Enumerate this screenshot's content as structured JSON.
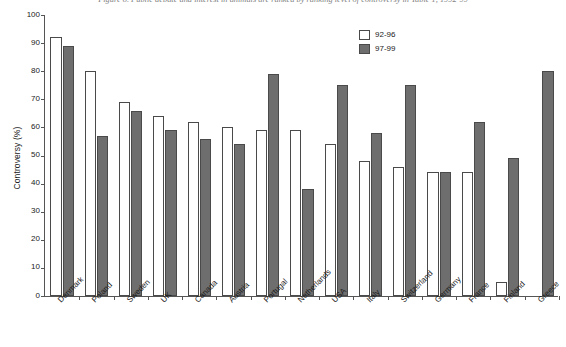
{
  "caption": "Figure 8. Public debate and interest in animals are ranked by ranking level of controversy in Table 1, 1992-99",
  "chart_data": {
    "type": "bar",
    "title": "",
    "xlabel": "",
    "ylabel": "Controversy (%)",
    "ylim": [
      0,
      100
    ],
    "ytick_step": 10,
    "yticks": [
      0,
      10,
      20,
      30,
      40,
      50,
      60,
      70,
      80,
      90,
      100
    ],
    "grid": false,
    "legend_position": "top-right",
    "categories": [
      "Denmark",
      "Poland",
      "Sweden",
      "UK",
      "Canada",
      "Austria",
      "Portugal",
      "Netherlands",
      "USA",
      "Italy",
      "Switzerland",
      "Germany",
      "France",
      "Finland",
      "Greece"
    ],
    "series": [
      {
        "name": "92-96",
        "color": "#ffffff",
        "values": [
          92,
          80,
          69,
          64,
          62,
          60,
          59,
          59,
          54,
          48,
          46,
          44,
          44,
          5,
          0
        ]
      },
      {
        "name": "97-99",
        "color": "#6e6e6e",
        "values": [
          89,
          57,
          66,
          59,
          56,
          54,
          79,
          38,
          75,
          58,
          75,
          44,
          62,
          49,
          80
        ]
      }
    ]
  },
  "legend": {
    "items": [
      {
        "label": "92-96",
        "swatch": "light"
      },
      {
        "label": "97-99",
        "swatch": "dark"
      }
    ]
  },
  "colors": {
    "bar_light": "#ffffff",
    "bar_dark": "#6e6e6e",
    "bar_outline": "#4a4a4a",
    "axis": "#555555",
    "text": "#1a1a1a",
    "background": "#ffffff"
  }
}
